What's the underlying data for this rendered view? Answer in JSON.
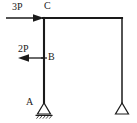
{
  "figure": {
    "type": "structural-frame-diagram",
    "background_color": "#ffffff",
    "line_color": "#1a1a1a",
    "text_color": "#1a1a1a"
  },
  "labels": {
    "load_top": "3P",
    "joint_top": "C",
    "load_mid": "2P",
    "joint_mid": "B",
    "support_left": "A"
  },
  "loads": [
    {
      "name": "load-3p",
      "label": "3P",
      "magnitude": "3P",
      "direction": "right",
      "applied_at": "C",
      "start_x": 6,
      "end_x": 44,
      "y": 18
    },
    {
      "name": "load-2p",
      "label": "2P",
      "magnitude": "2P",
      "direction": "left",
      "applied_at": "B",
      "start_x": 44,
      "end_x": 18,
      "y": 58
    }
  ],
  "members": [
    {
      "name": "left-column",
      "from": "C",
      "to": "A",
      "x1": 44,
      "y1": 18,
      "x2": 44,
      "y2": 103
    },
    {
      "name": "top-beam",
      "from": "C",
      "to": "right-top",
      "x1": 44,
      "y1": 18,
      "x2": 122,
      "y2": 18
    },
    {
      "name": "right-column",
      "from": "right-top",
      "to": "right-support",
      "x1": 122,
      "y1": 18,
      "x2": 122,
      "y2": 103
    }
  ],
  "joints": [
    {
      "name": "joint-c",
      "label": "C",
      "x": 44,
      "y": 18
    },
    {
      "name": "joint-b",
      "label": "B",
      "x": 44,
      "y": 58
    },
    {
      "name": "joint-a",
      "label": "A",
      "x": 44,
      "y": 103
    }
  ],
  "supports": [
    {
      "name": "support-a",
      "label": "A",
      "kind": "pinned",
      "x": 44,
      "y": 103,
      "has_ground_hatching": true
    },
    {
      "name": "support-right",
      "label": "",
      "kind": "pinned",
      "x": 122,
      "y": 103,
      "has_ground_hatching": false
    }
  ]
}
